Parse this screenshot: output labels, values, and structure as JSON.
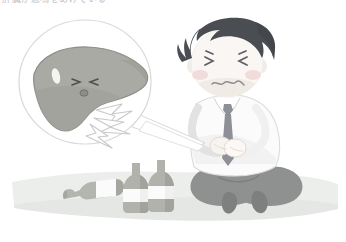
{
  "image": {
    "title_text": "肝臓が悲鳴をあげている",
    "width": 346,
    "height": 242,
    "background_color": "#ffffff",
    "style": "flat vector medical illustration, muted pastel palette"
  },
  "scene": {
    "description": "Man sitting cross-legged clutching his abdomen in pain, with a round thought bubble showing a distressed liver radiating pain bolts, and three alcohol bottles on the floor beside him.",
    "ground": {
      "name": "floor-band",
      "color": "#eceeec",
      "shadow_color": "#e3e6e3"
    }
  },
  "bubble": {
    "name": "thought-bubble",
    "outline_color": "#d8d8d8",
    "fill_color": "#ffffff",
    "center_x": 85,
    "center_y": 82,
    "radius_x": 66,
    "radius_y": 62,
    "tail_label": "jagged pointer toward the man's abdomen"
  },
  "liver": {
    "name": "liver-character",
    "body_color": "#a9aaa3",
    "body_shade_color": "#9b9c94",
    "outline_color": "#8e8f88",
    "highlight_color": "#f4f4f2",
    "face": {
      "left_eye": "squeezed-shut-eye",
      "right_eye": "squeezed-shut-eye",
      "mouth": "small open distressed mouth",
      "expression": "in pain"
    },
    "pain_bolts": {
      "name": "pain-bolt",
      "count": 3,
      "fill_color": "#ffffff",
      "outline_color": "#c9c9c9"
    }
  },
  "person": {
    "name": "seated-man",
    "hair_color": "#4a4d52",
    "skin_color": "#f7f3ef",
    "skin_shade_color": "#efe9e3",
    "blush_color": "#f0d7d6",
    "shirt_color": "#fbfbfb",
    "shirt_shade_color": "#eeeeee",
    "shirt_outline_color": "#dcdcdc",
    "tie_color": "#8d9097",
    "pants_color": "#8e918f",
    "pants_shade_color": "#7d807e",
    "face": {
      "left_eye": "squinting-closed-eye",
      "right_eye": "squinting-closed-eye",
      "mouth": "wavy worried mouth",
      "expression": "grimacing in pain"
    },
    "pose": "cross-legged, hands pressed to abdomen"
  },
  "bottles": [
    {
      "name": "bottle-fallen",
      "orientation": "lying on side",
      "glass_color": "#b3b5ae",
      "glass_shade_color": "#a4a69f",
      "label_color": "#fbfbfb",
      "x": 70,
      "y": 185
    },
    {
      "name": "bottle-standing-left",
      "orientation": "upright",
      "glass_color": "#b0b2ab",
      "glass_shade_color": "#a1a39c",
      "label_color": "#fbfbfb",
      "x": 137,
      "y": 160
    },
    {
      "name": "bottle-standing-right",
      "orientation": "upright",
      "glass_color": "#b0b2ab",
      "glass_shade_color": "#a1a39c",
      "label_color": "#fbfbfb",
      "x": 160,
      "y": 157
    }
  ]
}
